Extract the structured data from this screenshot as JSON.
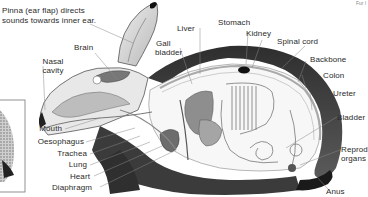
{
  "diagram": {
    "corner_text": "Fur l",
    "inset_box": "detail inset (partially visible)",
    "labels": {
      "pinna_line1": "Pinna (ear flap) directs",
      "pinna_line2": "sounds towards inner ear.",
      "brain": "Brain",
      "nasal_line1": "Nasal",
      "nasal_line2": "cavity",
      "gall_line1": "Gall",
      "gall_line2": "bladder",
      "liver": "Liver",
      "stomach": "Stomach",
      "kidney": "Kidney",
      "spinal_cord": "Spinal cord",
      "backbone": "Backbone",
      "colon": "Colon",
      "ureter": "Ureter",
      "bladder": "Bladder",
      "repro_line1": "Reprod",
      "repro_line2": "organs",
      "mouth": "Mouth",
      "oesophagus": "Oesophagus",
      "trachea": "Trachea",
      "lung": "Lung",
      "heart": "Heart",
      "diaphragm": "Diaphragm",
      "anus": "Anus"
    },
    "colors": {
      "fur": "#3a3a3a",
      "organ": "#9a9a9a",
      "line": "#777777",
      "text": "#2a2a2a"
    }
  }
}
